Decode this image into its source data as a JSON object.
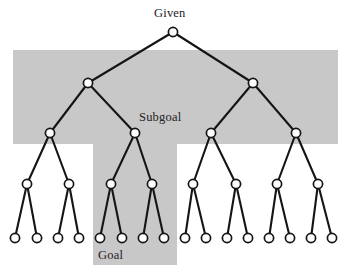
{
  "figure": {
    "width": 350,
    "height": 280,
    "background_color": "#ffffff",
    "band_color": "#c8c8c8",
    "line_color": "#151515",
    "node_fill_color": "#ffffff",
    "labels": {
      "given": "Given",
      "subgoal": "Subgoal",
      "goal": "Goal"
    }
  },
  "chart_data": {
    "type": "diagram",
    "subtype": "binary-tree",
    "depth": 4,
    "branching_factor": 2,
    "node_counts_by_level": [
      1,
      2,
      4,
      8,
      16
    ],
    "node_radius": 4.6,
    "levels": [
      {
        "level": 0,
        "y": 32,
        "nodes": [
          {
            "id": "n0",
            "x": 173,
            "label": "Given"
          }
        ]
      },
      {
        "level": 1,
        "y": 83,
        "nodes": [
          {
            "id": "n1-0",
            "x": 88
          },
          {
            "id": "n1-1",
            "x": 253
          }
        ]
      },
      {
        "level": 2,
        "y": 133,
        "nodes": [
          {
            "id": "n2-0",
            "x": 50
          },
          {
            "id": "n2-1",
            "x": 135
          },
          {
            "id": "n2-2",
            "x": 211
          },
          {
            "id": "n2-3",
            "x": 296
          }
        ]
      },
      {
        "level": 3,
        "y": 184,
        "nodes": [
          {
            "id": "n3-0",
            "x": 27
          },
          {
            "id": "n3-1",
            "x": 69
          },
          {
            "id": "n3-2",
            "x": 111
          },
          {
            "id": "n3-3",
            "x": 152
          },
          {
            "id": "n3-4",
            "x": 193
          },
          {
            "id": "n3-5",
            "x": 236
          },
          {
            "id": "n3-6",
            "x": 277
          },
          {
            "id": "n3-7",
            "x": 318
          }
        ]
      },
      {
        "level": 4,
        "y": 238,
        "nodes": [
          {
            "id": "n4-0",
            "x": 15
          },
          {
            "id": "n4-1",
            "x": 37
          },
          {
            "id": "n4-2",
            "x": 58
          },
          {
            "id": "n4-3",
            "x": 79
          },
          {
            "id": "n4-4",
            "x": 100
          },
          {
            "id": "n4-5",
            "x": 122
          },
          {
            "id": "n4-6",
            "x": 143
          },
          {
            "id": "n4-7",
            "x": 164
          },
          {
            "id": "n4-8",
            "x": 185
          },
          {
            "id": "n4-9",
            "x": 206
          },
          {
            "id": "n4-10",
            "x": 227
          },
          {
            "id": "n4-11",
            "x": 248
          },
          {
            "id": "n4-12",
            "x": 269
          },
          {
            "id": "n4-13",
            "x": 290
          },
          {
            "id": "n4-14",
            "x": 311
          },
          {
            "id": "n4-15",
            "x": 332
          }
        ]
      }
    ],
    "edges": [
      [
        "n0",
        "n1-0"
      ],
      [
        "n0",
        "n1-1"
      ],
      [
        "n1-0",
        "n2-0"
      ],
      [
        "n1-0",
        "n2-1"
      ],
      [
        "n1-1",
        "n2-2"
      ],
      [
        "n1-1",
        "n2-3"
      ],
      [
        "n2-0",
        "n3-0"
      ],
      [
        "n2-0",
        "n3-1"
      ],
      [
        "n2-1",
        "n3-2"
      ],
      [
        "n2-1",
        "n3-3"
      ],
      [
        "n2-2",
        "n3-4"
      ],
      [
        "n2-2",
        "n3-5"
      ],
      [
        "n2-3",
        "n3-6"
      ],
      [
        "n2-3",
        "n3-7"
      ],
      [
        "n3-0",
        "n4-0"
      ],
      [
        "n3-0",
        "n4-1"
      ],
      [
        "n3-1",
        "n4-2"
      ],
      [
        "n3-1",
        "n4-3"
      ],
      [
        "n3-2",
        "n4-4"
      ],
      [
        "n3-2",
        "n4-5"
      ],
      [
        "n3-3",
        "n4-6"
      ],
      [
        "n3-3",
        "n4-7"
      ],
      [
        "n3-4",
        "n4-8"
      ],
      [
        "n3-4",
        "n4-9"
      ],
      [
        "n3-5",
        "n4-10"
      ],
      [
        "n3-5",
        "n4-11"
      ],
      [
        "n3-6",
        "n4-12"
      ],
      [
        "n3-6",
        "n4-13"
      ],
      [
        "n3-7",
        "n4-14"
      ],
      [
        "n3-7",
        "n4-15"
      ]
    ],
    "highlight_regions": [
      {
        "name": "subgoal-band",
        "label": "Subgoal",
        "orientation": "horizontal",
        "x": 13,
        "y": 50,
        "width": 325,
        "height": 94,
        "color": "#c8c8c8"
      },
      {
        "name": "goal-band",
        "label": "Goal",
        "orientation": "vertical",
        "x": 93,
        "y": 50,
        "width": 84,
        "height": 215,
        "color": "#c8c8c8"
      }
    ],
    "annotations": [
      {
        "text": "Given",
        "x": 173,
        "y": 14,
        "anchor": "middle"
      },
      {
        "text": "Subgoal",
        "x": 161,
        "y": 120,
        "anchor": "middle"
      },
      {
        "text": "Goal",
        "x": 112,
        "y": 258,
        "anchor": "middle"
      }
    ]
  }
}
